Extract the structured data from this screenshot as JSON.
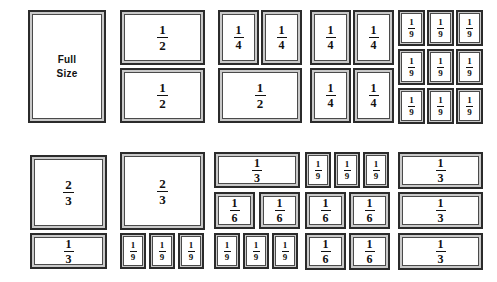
{
  "figure": {
    "background_color": "#ffffff",
    "block_frame_color": "#2b2b2b",
    "block_bevel_color": "#c9c9c9",
    "block_face_color": "#ffffff",
    "text_color": "#111111"
  },
  "labels": {
    "full_size_line1": "Full",
    "full_size_line2": "Size",
    "half": {
      "num": "1",
      "den": "2"
    },
    "third": {
      "num": "1",
      "den": "3"
    },
    "two_thirds": {
      "num": "2",
      "den": "3"
    },
    "quarter": {
      "num": "1",
      "den": "4"
    },
    "sixth": {
      "num": "1",
      "den": "6"
    },
    "ninth": {
      "num": "1",
      "den": "9"
    }
  },
  "columns": [
    {
      "id": "col-full-size",
      "caption": "Full Size",
      "blocks": [
        {
          "label": "Full Size",
          "value": 1,
          "x": 28,
          "y": 10,
          "w": 78,
          "h": 113,
          "text": "full"
        }
      ]
    },
    {
      "id": "col-halves",
      "caption": "Two halves",
      "blocks": [
        {
          "label": "1/2",
          "value": 0.5,
          "x": 120,
          "y": 10,
          "w": 85,
          "h": 55,
          "text": "half"
        },
        {
          "label": "1/2",
          "value": 0.5,
          "x": 120,
          "y": 68,
          "w": 85,
          "h": 55,
          "text": "half"
        }
      ]
    },
    {
      "id": "col-quarters-and-half",
      "caption": "Two quarters and one half",
      "blocks": [
        {
          "label": "1/4",
          "value": 0.25,
          "x": 218,
          "y": 10,
          "w": 41,
          "h": 55,
          "text": "quarter"
        },
        {
          "label": "1/4",
          "value": 0.25,
          "x": 261,
          "y": 10,
          "w": 41,
          "h": 55,
          "text": "quarter"
        },
        {
          "label": "1/2",
          "value": 0.5,
          "x": 218,
          "y": 68,
          "w": 84,
          "h": 55,
          "text": "half"
        }
      ]
    },
    {
      "id": "col-quarters",
      "caption": "Four quarters",
      "blocks": [
        {
          "label": "1/4",
          "value": 0.25,
          "x": 310,
          "y": 10,
          "w": 41,
          "h": 55,
          "text": "quarter"
        },
        {
          "label": "1/4",
          "value": 0.25,
          "x": 353,
          "y": 10,
          "w": 41,
          "h": 55,
          "text": "quarter"
        },
        {
          "label": "1/4",
          "value": 0.25,
          "x": 310,
          "y": 68,
          "w": 41,
          "h": 55,
          "text": "quarter"
        },
        {
          "label": "1/4",
          "value": 0.25,
          "x": 353,
          "y": 68,
          "w": 41,
          "h": 55,
          "text": "quarter"
        }
      ]
    },
    {
      "id": "col-ninths",
      "caption": "Nine ninths",
      "blocks": [
        {
          "label": "1/9",
          "value": 0.1111,
          "x": 398,
          "y": 10,
          "w": 27,
          "h": 36,
          "text": "ninth"
        },
        {
          "label": "1/9",
          "value": 0.1111,
          "x": 427,
          "y": 10,
          "w": 27,
          "h": 36,
          "text": "ninth"
        },
        {
          "label": "1/9",
          "value": 0.1111,
          "x": 456,
          "y": 10,
          "w": 27,
          "h": 36,
          "text": "ninth"
        },
        {
          "label": "1/9",
          "value": 0.1111,
          "x": 398,
          "y": 49,
          "w": 27,
          "h": 36,
          "text": "ninth"
        },
        {
          "label": "1/9",
          "value": 0.1111,
          "x": 427,
          "y": 49,
          "w": 27,
          "h": 36,
          "text": "ninth"
        },
        {
          "label": "1/9",
          "value": 0.1111,
          "x": 456,
          "y": 49,
          "w": 27,
          "h": 36,
          "text": "ninth"
        },
        {
          "label": "1/9",
          "value": 0.1111,
          "x": 398,
          "y": 88,
          "w": 27,
          "h": 36,
          "text": "ninth"
        },
        {
          "label": "1/9",
          "value": 0.1111,
          "x": 427,
          "y": 88,
          "w": 27,
          "h": 36,
          "text": "ninth"
        },
        {
          "label": "1/9",
          "value": 0.1111,
          "x": 456,
          "y": 88,
          "w": 27,
          "h": 36,
          "text": "ninth"
        }
      ]
    },
    {
      "id": "col-two-thirds-third",
      "caption": "Two thirds and one third",
      "blocks": [
        {
          "label": "2/3",
          "value": 0.6667,
          "x": 30,
          "y": 155,
          "w": 77,
          "h": 75,
          "text": "two_thirds"
        },
        {
          "label": "1/3",
          "value": 0.3333,
          "x": 30,
          "y": 233,
          "w": 77,
          "h": 36,
          "text": "third"
        }
      ]
    },
    {
      "id": "col-two-thirds-ninths",
      "caption": "Two thirds and three ninths",
      "blocks": [
        {
          "label": "2/3",
          "value": 0.6667,
          "x": 120,
          "y": 152,
          "w": 85,
          "h": 78,
          "text": "two_thirds"
        },
        {
          "label": "1/9",
          "value": 0.1111,
          "x": 120,
          "y": 233,
          "w": 26,
          "h": 36,
          "text": "ninth"
        },
        {
          "label": "1/9",
          "value": 0.1111,
          "x": 149,
          "y": 233,
          "w": 26,
          "h": 36,
          "text": "ninth"
        },
        {
          "label": "1/9",
          "value": 0.1111,
          "x": 178,
          "y": 233,
          "w": 26,
          "h": 36,
          "text": "ninth"
        }
      ]
    },
    {
      "id": "col-third-sixths-ninths",
      "caption": "One third, two sixths and three ninths",
      "blocks": [
        {
          "label": "1/3",
          "value": 0.3333,
          "x": 214,
          "y": 152,
          "w": 86,
          "h": 36,
          "text": "third"
        },
        {
          "label": "1/6",
          "value": 0.1667,
          "x": 214,
          "y": 192,
          "w": 41,
          "h": 37,
          "text": "sixth"
        },
        {
          "label": "1/6",
          "value": 0.1667,
          "x": 259,
          "y": 192,
          "w": 41,
          "h": 37,
          "text": "sixth"
        },
        {
          "label": "1/9",
          "value": 0.1111,
          "x": 214,
          "y": 233,
          "w": 26,
          "h": 36,
          "text": "ninth"
        },
        {
          "label": "1/9",
          "value": 0.1111,
          "x": 243,
          "y": 233,
          "w": 26,
          "h": 36,
          "text": "ninth"
        },
        {
          "label": "1/9",
          "value": 0.1111,
          "x": 272,
          "y": 233,
          "w": 26,
          "h": 36,
          "text": "ninth"
        }
      ]
    },
    {
      "id": "col-ninths-sixths",
      "caption": "Three ninths and four sixths",
      "blocks": [
        {
          "label": "1/9",
          "value": 0.1111,
          "x": 305,
          "y": 152,
          "w": 26,
          "h": 36,
          "text": "ninth"
        },
        {
          "label": "1/9",
          "value": 0.1111,
          "x": 334,
          "y": 152,
          "w": 26,
          "h": 36,
          "text": "ninth"
        },
        {
          "label": "1/9",
          "value": 0.1111,
          "x": 363,
          "y": 152,
          "w": 26,
          "h": 36,
          "text": "ninth"
        },
        {
          "label": "1/6",
          "value": 0.1667,
          "x": 305,
          "y": 192,
          "w": 41,
          "h": 37,
          "text": "sixth"
        },
        {
          "label": "1/6",
          "value": 0.1667,
          "x": 349,
          "y": 192,
          "w": 41,
          "h": 37,
          "text": "sixth"
        },
        {
          "label": "1/6",
          "value": 0.1667,
          "x": 305,
          "y": 233,
          "w": 41,
          "h": 37,
          "text": "sixth"
        },
        {
          "label": "1/6",
          "value": 0.1667,
          "x": 349,
          "y": 233,
          "w": 41,
          "h": 37,
          "text": "sixth"
        }
      ]
    },
    {
      "id": "col-thirds",
      "caption": "Three thirds",
      "blocks": [
        {
          "label": "1/3",
          "value": 0.3333,
          "x": 398,
          "y": 152,
          "w": 85,
          "h": 37,
          "text": "third"
        },
        {
          "label": "1/3",
          "value": 0.3333,
          "x": 398,
          "y": 192,
          "w": 85,
          "h": 37,
          "text": "third"
        },
        {
          "label": "1/3",
          "value": 0.3333,
          "x": 398,
          "y": 233,
          "w": 85,
          "h": 37,
          "text": "third"
        }
      ]
    }
  ]
}
